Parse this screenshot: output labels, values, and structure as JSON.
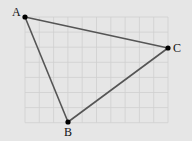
{
  "diagram": {
    "type": "triangle-on-grid",
    "grid": {
      "x0": 25,
      "y0": 17,
      "cols": 10,
      "rows": 7,
      "cell_w": 14.3,
      "cell_h": 15.1,
      "line_color": "#cfcfcf",
      "background": "#e6e6e6"
    },
    "points": [
      {
        "label": "A",
        "x": 25,
        "y": 17,
        "label_dx": -13,
        "label_dy": -1
      },
      {
        "label": "B",
        "x": 68,
        "y": 122,
        "label_dx": -4,
        "label_dy": 14
      },
      {
        "label": "C",
        "x": 168,
        "y": 48,
        "label_dx": 5,
        "label_dy": 4
      }
    ],
    "edges": [
      [
        "A",
        "B"
      ],
      [
        "B",
        "C"
      ],
      [
        "C",
        "A"
      ]
    ],
    "stroke_color": "#555555",
    "point_color": "#000000"
  }
}
